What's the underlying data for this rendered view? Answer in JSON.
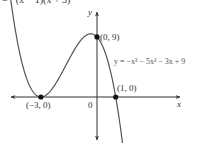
{
  "header": {
    "partial_text": "= −(x − 1)(x + 3)²"
  },
  "chart_data": {
    "type": "line",
    "title": "",
    "function": "y = -x^3 - 5x^2 - 3x + 9",
    "equation_label": "y = −x³ − 5x² − 3x + 9",
    "factored_form": "y = −(x − 1)(x + 3)²",
    "xlabel": "x",
    "ylabel": "y",
    "origin_label": "0",
    "grid": false,
    "points": [
      {
        "label": "(−3, 0)",
        "x": -3,
        "y": 0
      },
      {
        "label": "(0, 9)",
        "x": 0,
        "y": 9
      },
      {
        "label": "(1, 0)",
        "x": 1,
        "y": 0
      }
    ],
    "x_range": [
      -4.7,
      1.5
    ],
    "y_range": [
      -6.5,
      12.5
    ]
  }
}
